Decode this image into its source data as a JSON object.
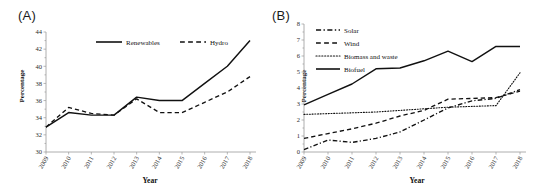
{
  "figure": {
    "panels": [
      {
        "label": "(A)",
        "ylabel": "Percentage",
        "xlabel": "Year"
      },
      {
        "label": "(B)",
        "ylabel": "Percentage",
        "xlabel": "Year"
      }
    ]
  },
  "chart_data": [
    {
      "type": "line",
      "title": "(A)",
      "xlabel": "Year",
      "ylabel": "Percentage",
      "categories": [
        "2009",
        "2010",
        "2011",
        "2012",
        "2013",
        "2014",
        "2015",
        "2016",
        "2017",
        "2018"
      ],
      "ylim": [
        30,
        44
      ],
      "yticks": [
        30,
        32,
        34,
        36,
        38,
        40,
        42,
        44
      ],
      "grid": false,
      "legend_position": "top-inside",
      "series": [
        {
          "name": "Renewables",
          "style": "solid",
          "values": [
            32.9,
            34.6,
            34.3,
            34.3,
            36.4,
            36.0,
            36.0,
            38.0,
            40.0,
            43.0
          ]
        },
        {
          "name": "Hydro",
          "style": "dashed",
          "values": [
            32.9,
            35.2,
            34.5,
            34.3,
            36.2,
            34.6,
            34.6,
            35.8,
            37.0,
            38.8
          ]
        }
      ]
    },
    {
      "type": "line",
      "title": "(B)",
      "xlabel": "Year",
      "ylabel": "Percentage",
      "categories": [
        "2009",
        "2010",
        "2011",
        "2012",
        "2013",
        "2014",
        "2015",
        "2016",
        "2017",
        "2018"
      ],
      "ylim": [
        0,
        8
      ],
      "yticks": [
        0,
        1,
        2,
        3,
        4,
        5,
        6,
        7,
        8
      ],
      "grid": false,
      "legend_position": "top-left-inside",
      "series": [
        {
          "name": "Solar",
          "style": "dash-dot",
          "values": [
            0.15,
            0.75,
            0.6,
            0.85,
            1.25,
            2.0,
            2.75,
            3.2,
            3.35,
            3.9
          ]
        },
        {
          "name": "Wind",
          "style": "dashed",
          "values": [
            0.85,
            1.15,
            1.45,
            1.8,
            2.25,
            2.6,
            3.3,
            3.35,
            3.4,
            3.8
          ]
        },
        {
          "name": "Biomass and waste",
          "style": "dotted",
          "values": [
            2.35,
            2.4,
            2.45,
            2.5,
            2.6,
            2.7,
            2.8,
            2.85,
            2.9,
            4.95
          ]
        },
        {
          "name": "Biofuel",
          "style": "solid",
          "values": [
            2.95,
            3.6,
            4.25,
            5.2,
            5.25,
            5.7,
            6.3,
            5.65,
            6.6,
            6.6
          ]
        }
      ]
    }
  ]
}
